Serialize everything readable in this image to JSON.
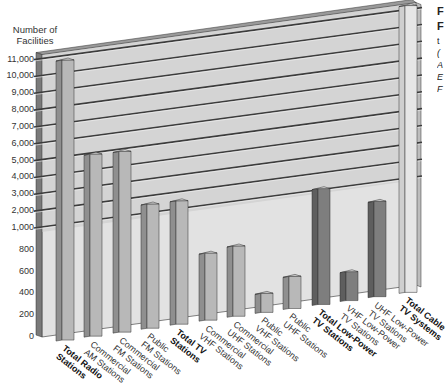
{
  "chart_data": {
    "type": "bar",
    "title": "",
    "xlabel": "",
    "ylabel": "Number of Facilities",
    "y_scale": "broken",
    "y_ticks_lower": [
      "0",
      "200",
      "400",
      "600",
      "800"
    ],
    "y_ticks_upper": [
      "1,000",
      "2,000",
      "3,000",
      "4,000",
      "5,000",
      "6,000",
      "7,000",
      "8,000",
      "9,000",
      "10,000",
      "11,000"
    ],
    "ylim": [
      0,
      11000
    ],
    "grid": true,
    "categories": [
      "Total Radio Stations",
      "Commercial AM Stations",
      "Commercial FM Stations",
      "Public FM Stations",
      "Total TV Stations",
      "Commercial VHF Stations",
      "Commercial UHF Stations",
      "Public VHF Stations",
      "Public UHF Stations",
      "Total Low-Power TV Stations",
      "VHF Low-Power TV Stations",
      "UHF Low-Power TV Stations",
      "Total Cable TV Systems"
    ],
    "values": [
      10800,
      4980,
      4900,
      1550,
      1500,
      560,
      590,
      120,
      240,
      1050,
      210,
      820,
      11200
    ],
    "bold_categories": [
      "Total Radio Stations",
      "Total TV Stations",
      "Total Low-Power TV Stations",
      "Total Cable TV Systems"
    ]
  },
  "axis": {
    "title_line1": "Number of",
    "title_line2": "Facilities"
  },
  "x_labels": [
    {
      "l1": "Total Radio",
      "l2": "Stations",
      "bold": true
    },
    {
      "l1": "Commercial",
      "l2": "AM Stations",
      "bold": false
    },
    {
      "l1": "Commercial",
      "l2": "FM Stations",
      "bold": false
    },
    {
      "l1": "Public",
      "l2": "FM Stations",
      "bold": false
    },
    {
      "l1": "Total TV",
      "l2": "Stations",
      "bold": true
    },
    {
      "l1": "Commercial",
      "l2": "VHF Stations",
      "bold": false
    },
    {
      "l1": "Commercial",
      "l2": "UHF Stations",
      "bold": false
    },
    {
      "l1": "Public",
      "l2": "VHF Stations",
      "bold": false
    },
    {
      "l1": "Public",
      "l2": "UHF Stations",
      "bold": false
    },
    {
      "l1": "Total Low-Power",
      "l2": "TV Stations",
      "bold": true
    },
    {
      "l1": "VHF Low-Power",
      "l2": "TV Stations",
      "bold": false
    },
    {
      "l1": "UHF Low-Power",
      "l2": "TV Stations",
      "bold": false
    },
    {
      "l1": "Total Cable",
      "l2": "TV Systems",
      "bold": true
    }
  ],
  "side_text": [
    "F",
    "F",
    "t",
    "(",
    "A",
    "E",
    "F"
  ],
  "colors": {
    "wall": "#d4d4d4",
    "wall_lower": "#e2e2e2",
    "left_wall": "#7a7a7a",
    "grid_line": "#3c3c3c",
    "bar_front": "#b8b8b8",
    "bar_side": "#8f8f8f",
    "bar_top": "#cfcfcf",
    "bar_front_dark": "#7e7e7e",
    "bar_side_dark": "#5e5e5e",
    "bar_front_light": "#e6e6e6",
    "bar_side_light": "#cfcfcf",
    "outline": "#333333"
  }
}
